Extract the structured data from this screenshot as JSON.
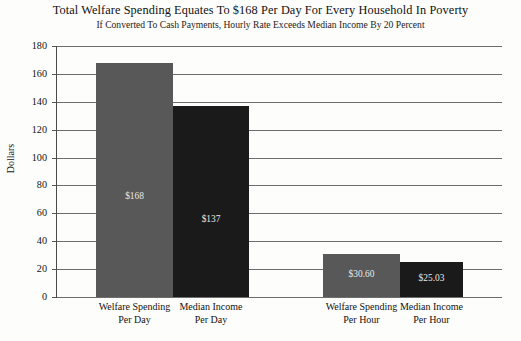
{
  "chart_data": {
    "type": "bar",
    "title": "Total Welfare Spending Equates To $168 Per Day For Every Household In Poverty",
    "subtitle": "If Converted To Cash Payments, Hourly Rate Exceeds Median Income By 20 Percent",
    "xlabel": "",
    "ylabel": "Dollars",
    "ylim": [
      0,
      180
    ],
    "ytick_values": [
      0,
      20,
      40,
      60,
      80,
      100,
      120,
      140,
      160,
      180
    ],
    "ytick_labels": [
      "0",
      "20",
      "40",
      "60",
      "80",
      "100",
      "120",
      "140",
      "160",
      "180"
    ],
    "grid": true,
    "legend": "none",
    "categories": [
      "Welfare Spending Per Day",
      "Median Income Per Day",
      "Welfare Spending Per Hour",
      "Median Income Per Hour"
    ],
    "bars": [
      {
        "label_line1": "Welfare Spending",
        "label_line2": "Per Day",
        "value": 168,
        "value_label": "$168",
        "color": "#585858"
      },
      {
        "label_line1": "Median Income",
        "label_line2": "Per Day",
        "value": 137,
        "value_label": "$137",
        "color": "#1a1a1a"
      },
      {
        "label_line1": "Welfare Spending",
        "label_line2": "Per Hour",
        "value": 30.6,
        "value_label": "$30.60",
        "color": "#585858"
      },
      {
        "label_line1": "Median Income",
        "label_line2": "Per Hour",
        "value": 25.03,
        "value_label": "$25.03",
        "color": "#1a1a1a"
      }
    ],
    "colors": {
      "series_light": "#585858",
      "series_dark": "#1a1a1a",
      "gridline": "#6d6d6d",
      "axis": "#4a4a4a",
      "background": "#fdfdfb",
      "text": "#121212",
      "value_text": "#e9e9e9"
    }
  }
}
